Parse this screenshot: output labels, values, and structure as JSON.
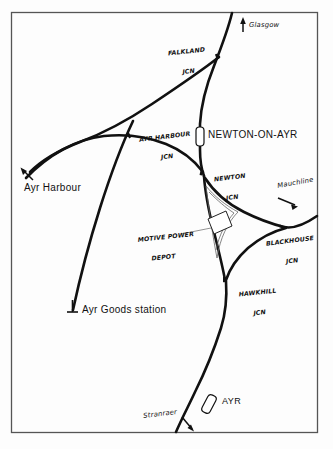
{
  "diagram": {
    "type": "railway-schematic",
    "title_visible": false,
    "frame": {
      "x": 11,
      "y": 12,
      "width": 307,
      "height": 421,
      "color": "#555555"
    },
    "background_color": "#fdfdfd",
    "line_color": "#111111",
    "destinations": [
      {
        "name": "glasgow",
        "label": "Glasgow",
        "arrow_direction": "up"
      },
      {
        "name": "mauchline",
        "label": "Mauchline",
        "arrow_direction": "right-down"
      },
      {
        "name": "stranraer",
        "label": "Stranraer",
        "arrow_direction": "down-right"
      },
      {
        "name": "ayr-harbour",
        "label": "Ayr Harbour",
        "arrow_direction": "up-left"
      }
    ],
    "junctions": [
      {
        "name": "falkland-jcn",
        "line1": "FALKLAND",
        "line2": "JCN"
      },
      {
        "name": "ayr-harbour-jcn",
        "line1": "AYR HARBOUR",
        "line2": "JCN"
      },
      {
        "name": "newton-jcn",
        "line1": "NEWTON",
        "line2": "JCN"
      },
      {
        "name": "blackhouse-jcn",
        "line1": "BLACKHOUSE",
        "line2": "JCN"
      },
      {
        "name": "hawkhill-jcn",
        "line1": "HAWKHILL",
        "line2": "JCN"
      }
    ],
    "stations": [
      {
        "name": "newton-on-ayr",
        "label": "NEWTON-ON-AYR",
        "symbol": "station-box"
      },
      {
        "name": "ayr",
        "label": "AYR",
        "symbol": "station-box"
      },
      {
        "name": "ayr-goods-station",
        "label": "Ayr Goods station",
        "symbol": "buffer-stop"
      }
    ],
    "facilities": [
      {
        "name": "motive-power-depot",
        "line1": "MOTIVE POWER",
        "line2": "DEPOT",
        "symbol": "depot-triangle-with-shed"
      }
    ]
  }
}
